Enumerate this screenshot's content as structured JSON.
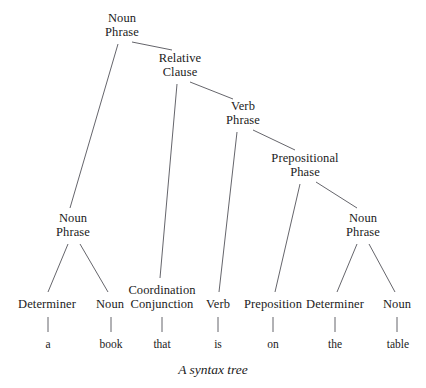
{
  "figure": {
    "caption": "A syntax tree",
    "caption_y": 362,
    "width": 426,
    "height": 388,
    "background_color": "#ffffff",
    "line_color": "#53535a",
    "text_color": "#1b1b1b"
  },
  "chart_data": {
    "type": "diagram",
    "subtype": "syntax-tree",
    "title": "A syntax tree",
    "sentence": "a book that is on the table",
    "nodes": [
      {
        "id": "np-root",
        "label_line1": "Noun",
        "label_line2": "Phrase",
        "x": 122,
        "y": 12,
        "bottom": 42,
        "kind": "phrase"
      },
      {
        "id": "rel-clause",
        "label_line1": "Relative",
        "label_line2": "Clause",
        "x": 180,
        "y": 52,
        "bottom": 82,
        "kind": "phrase"
      },
      {
        "id": "vp",
        "label_line1": "Verb",
        "label_line2": "Phrase",
        "x": 243,
        "y": 100,
        "bottom": 130,
        "kind": "phrase"
      },
      {
        "id": "pp",
        "label_line1": "Prepositional",
        "label_line2": "Phase",
        "x": 305,
        "y": 152,
        "bottom": 182,
        "kind": "phrase"
      },
      {
        "id": "np-left",
        "label_line1": "Noun",
        "label_line2": "Phrase",
        "x": 73,
        "y": 212,
        "bottom": 242,
        "kind": "phrase"
      },
      {
        "id": "np-right",
        "label_line1": "Noun",
        "label_line2": "Phrase",
        "x": 363,
        "y": 212,
        "bottom": 242,
        "kind": "phrase"
      },
      {
        "id": "det-1",
        "label_line1": "Determiner",
        "label_line2": "",
        "x": 47,
        "y": 298,
        "bottom": 312,
        "kind": "pos"
      },
      {
        "id": "noun-1",
        "label_line1": "Noun",
        "label_line2": "",
        "x": 110,
        "y": 298,
        "bottom": 312,
        "kind": "pos"
      },
      {
        "id": "conj",
        "label_line1": "Coordination",
        "label_line2": "Conjunction",
        "x": 162,
        "y": 284,
        "bottom": 312,
        "kind": "pos"
      },
      {
        "id": "verb",
        "label_line1": "Verb",
        "label_line2": "",
        "x": 218,
        "y": 298,
        "bottom": 312,
        "kind": "pos"
      },
      {
        "id": "prep",
        "label_line1": "Preposition",
        "label_line2": "",
        "x": 273,
        "y": 298,
        "bottom": 312,
        "kind": "pos"
      },
      {
        "id": "det-2",
        "label_line1": "Determiner",
        "label_line2": "",
        "x": 335,
        "y": 298,
        "bottom": 312,
        "kind": "pos"
      },
      {
        "id": "noun-2",
        "label_line1": "Noun",
        "label_line2": "",
        "x": 397,
        "y": 298,
        "bottom": 312,
        "kind": "pos"
      }
    ],
    "words": [
      {
        "id": "word-a",
        "text": "a",
        "x": 48,
        "y": 338,
        "parent": "det-1"
      },
      {
        "id": "word-book",
        "text": "book",
        "x": 111,
        "y": 338,
        "parent": "noun-1"
      },
      {
        "id": "word-that",
        "text": "that",
        "x": 162,
        "y": 338,
        "parent": "conj"
      },
      {
        "id": "word-is",
        "text": "is",
        "x": 218,
        "y": 338,
        "parent": "verb"
      },
      {
        "id": "word-on",
        "text": "on",
        "x": 273,
        "y": 338,
        "parent": "prep"
      },
      {
        "id": "word-the",
        "text": "the",
        "x": 335,
        "y": 338,
        "parent": "det-2"
      },
      {
        "id": "word-table",
        "text": "table",
        "x": 398,
        "y": 338,
        "parent": "noun-2"
      }
    ],
    "edges": [
      {
        "from": "np-root",
        "to": "np-left",
        "x1": 118,
        "y1": 44,
        "x2": 70,
        "y2": 208
      },
      {
        "from": "np-root",
        "to": "rel-clause",
        "x1": 132,
        "y1": 42,
        "x2": 172,
        "y2": 50
      },
      {
        "from": "rel-clause",
        "to": "conj",
        "x1": 177,
        "y1": 84,
        "x2": 160,
        "y2": 278
      },
      {
        "from": "rel-clause",
        "to": "vp",
        "x1": 190,
        "y1": 82,
        "x2": 233,
        "y2": 99
      },
      {
        "from": "vp",
        "to": "verb",
        "x1": 237,
        "y1": 132,
        "x2": 219,
        "y2": 292
      },
      {
        "from": "vp",
        "to": "pp",
        "x1": 253,
        "y1": 130,
        "x2": 295,
        "y2": 150
      },
      {
        "from": "pp",
        "to": "prep",
        "x1": 300,
        "y1": 184,
        "x2": 275,
        "y2": 292
      },
      {
        "from": "pp",
        "to": "np-right",
        "x1": 316,
        "y1": 182,
        "x2": 357,
        "y2": 208
      },
      {
        "from": "np-left",
        "to": "det-1",
        "x1": 68,
        "y1": 244,
        "x2": 48,
        "y2": 292
      },
      {
        "from": "np-left",
        "to": "noun-1",
        "x1": 80,
        "y1": 244,
        "x2": 108,
        "y2": 292
      },
      {
        "from": "np-right",
        "to": "det-2",
        "x1": 357,
        "y1": 244,
        "x2": 337,
        "y2": 292
      },
      {
        "from": "np-right",
        "to": "noun-2",
        "x1": 369,
        "y1": 244,
        "x2": 395,
        "y2": 292
      },
      {
        "from": "det-1",
        "to": "word-a",
        "x1": 48,
        "y1": 317,
        "x2": 48,
        "y2": 332
      },
      {
        "from": "noun-1",
        "to": "word-book",
        "x1": 111,
        "y1": 317,
        "x2": 111,
        "y2": 332
      },
      {
        "from": "conj",
        "to": "word-that",
        "x1": 162,
        "y1": 317,
        "x2": 162,
        "y2": 332
      },
      {
        "from": "verb",
        "to": "word-is",
        "x1": 218,
        "y1": 317,
        "x2": 218,
        "y2": 332
      },
      {
        "from": "prep",
        "to": "word-on",
        "x1": 273,
        "y1": 317,
        "x2": 273,
        "y2": 332
      },
      {
        "from": "det-2",
        "to": "word-the",
        "x1": 335,
        "y1": 317,
        "x2": 335,
        "y2": 332
      },
      {
        "from": "noun-2",
        "to": "word-table",
        "x1": 397,
        "y1": 317,
        "x2": 397,
        "y2": 332
      }
    ]
  }
}
